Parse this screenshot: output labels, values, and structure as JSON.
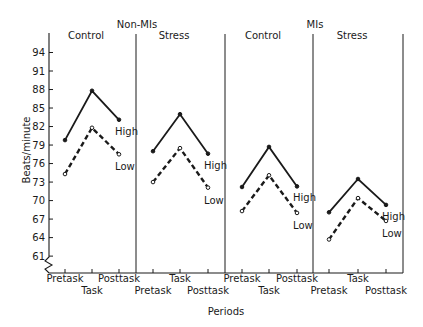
{
  "chart_data": {
    "type": "line",
    "title": "",
    "ylabel": "Beats/minute",
    "xlabel": "Periods",
    "ylim": [
      61,
      94
    ],
    "yticks": [
      94,
      91,
      88,
      85,
      82,
      79,
      76,
      73,
      70,
      67,
      64,
      61
    ],
    "categories": [
      "Pretask",
      "Task",
      "Posttask"
    ],
    "groups": [
      {
        "group": "Non-MIs",
        "panels": [
          {
            "panel": "Control",
            "series": [
              {
                "name": "High",
                "style": "solid",
                "values": [
                  79.8,
                  87.8,
                  83.1
                ]
              },
              {
                "name": "Low",
                "style": "dashed",
                "values": [
                  74.3,
                  81.8,
                  77.5
                ]
              }
            ]
          },
          {
            "panel": "Stress",
            "series": [
              {
                "name": "High",
                "style": "solid",
                "values": [
                  78.0,
                  84.0,
                  77.6
                ]
              },
              {
                "name": "Low",
                "style": "dashed",
                "values": [
                  73.0,
                  78.5,
                  72.1
                ]
              }
            ]
          }
        ]
      },
      {
        "group": "MIs",
        "panels": [
          {
            "panel": "Control",
            "series": [
              {
                "name": "High",
                "style": "solid",
                "values": [
                  72.2,
                  78.7,
                  72.3
                ]
              },
              {
                "name": "Low",
                "style": "dashed",
                "values": [
                  68.3,
                  74.1,
                  68.0
                ]
              }
            ]
          },
          {
            "panel": "Stress",
            "series": [
              {
                "name": "High",
                "style": "solid",
                "values": [
                  68.1,
                  73.5,
                  69.3
                ]
              },
              {
                "name": "Low",
                "style": "dashed",
                "values": [
                  63.7,
                  70.4,
                  66.7
                ]
              }
            ]
          }
        ]
      }
    ],
    "grid": false,
    "legend": "inline labels High / Low at end of lines"
  },
  "labels": {
    "ylabel": "Beats/minute",
    "xlabel": "Periods",
    "groups": [
      "Non-MIs",
      "MIs"
    ],
    "panels": [
      "Control",
      "Stress",
      "Control",
      "Stress"
    ],
    "series": [
      "High",
      "Low"
    ],
    "periods": [
      "Pretask",
      "Task",
      "Posttask"
    ]
  }
}
